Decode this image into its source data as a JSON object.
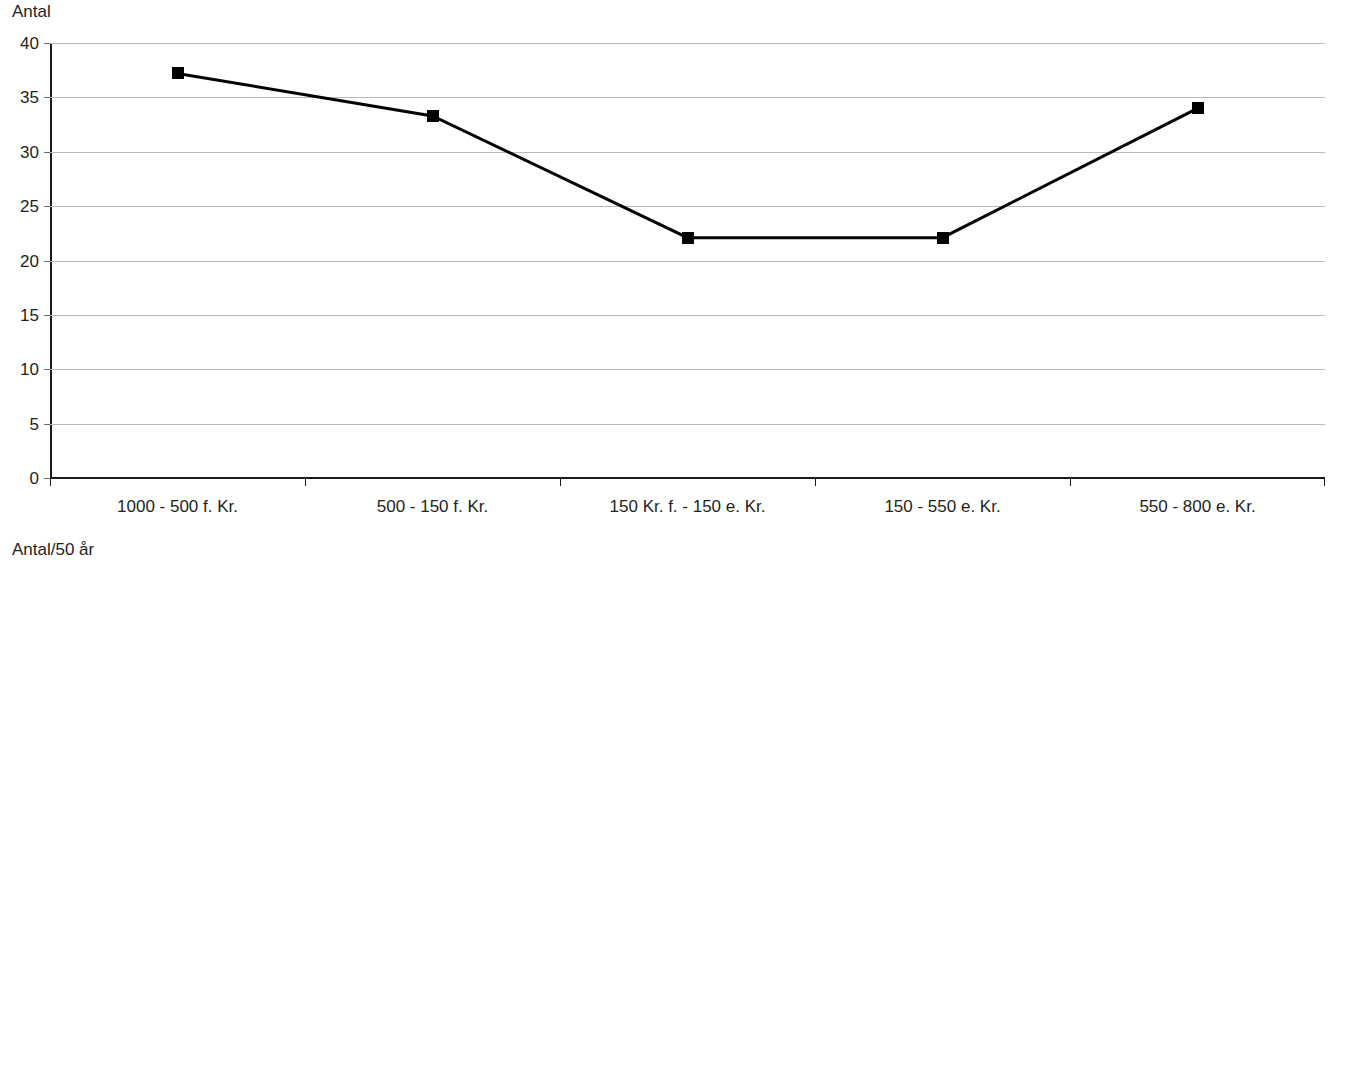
{
  "page": {
    "background_color": "#ffffff",
    "line_color": "#000000",
    "marker_color": "#000000",
    "gridline_color": "#b9b9b9",
    "axis_color": "#1a1a1a"
  },
  "charts": [
    {
      "id": "chart-top",
      "axis_title": "Antal",
      "ytick_labels": [
        "40",
        "35",
        "30",
        "25",
        "20",
        "15",
        "10",
        "5",
        "0"
      ],
      "xtick_labels": [
        "1000 - 500 f. Kr.",
        "500 - 150 f. Kr.",
        "150 Kr. f. - 150 e. Kr.",
        "150 - 550 e. Kr.",
        "550 - 800 e. Kr."
      ]
    },
    {
      "id": "chart-bottom",
      "axis_title": "Antal/50 år",
      "ytick_labels": [
        "8",
        "7",
        "6",
        "5",
        "4",
        "3",
        "2",
        "1",
        "0"
      ],
      "xtick_labels": [
        "1000 - 500 f. Kr.",
        "500 - 150 f. Kr.",
        "150 Kr. f. - 150 e. Kr.",
        "150 - 550 e. Kr.",
        "550 - 800 e. Kr."
      ]
    }
  ],
  "chart_data": [
    {
      "type": "line",
      "title": "Antal",
      "xlabel": "",
      "ylabel": "Antal",
      "ylim": [
        0,
        40
      ],
      "yticks": [
        0,
        5,
        10,
        15,
        20,
        25,
        30,
        35,
        40
      ],
      "grid": true,
      "legend": "none",
      "marker": "square",
      "categories": [
        "1000 - 500 f. Kr.",
        "500 - 150 f. Kr.",
        "150 Kr. f. - 150 e. Kr.",
        "150 - 550 e. Kr.",
        "550 - 800 e. Kr."
      ],
      "values": [
        37.2,
        33.3,
        22.1,
        22.1,
        34.0
      ]
    },
    {
      "type": "line",
      "title": "Antal/50 år",
      "xlabel": "",
      "ylabel": "Antal/50 år",
      "ylim": [
        0,
        8
      ],
      "yticks": [
        0,
        1,
        2,
        3,
        4,
        5,
        6,
        7,
        8
      ],
      "grid": true,
      "legend": "none",
      "marker": "square",
      "categories": [
        "1000 - 500 f. Kr.",
        "500 - 150 f. Kr.",
        "150 Kr. f. - 150 e. Kr.",
        "150 - 550 e. Kr.",
        "550 - 800 e. Kr."
      ],
      "values": [
        3.7,
        4.7,
        3.65,
        2.75,
        6.8
      ]
    }
  ]
}
